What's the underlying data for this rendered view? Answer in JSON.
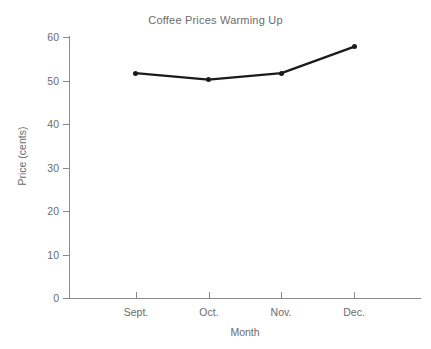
{
  "chart_data": {
    "type": "line",
    "title": "Coffee Prices Warming Up",
    "xlabel": "Month",
    "ylabel": "Price (cents)",
    "categories": [
      "Sept.",
      "Oct.",
      "Nov.",
      "Dec."
    ],
    "values": [
      51.7,
      50.2,
      51.7,
      57.8
    ],
    "series": [
      {
        "name": "Coffee price",
        "values": [
          51.7,
          50.2,
          51.7,
          57.8
        ]
      }
    ],
    "ylim": [
      0,
      60
    ],
    "yticks": [
      0,
      10,
      20,
      30,
      40,
      50,
      60
    ],
    "ytick_labels": [
      "0",
      "10",
      "20",
      "30",
      "40",
      "50",
      "60"
    ],
    "xtick_labels": [
      "Sept.",
      "Oct.",
      "Nov.",
      "Dec."
    ],
    "grid": false,
    "legend": "none",
    "marker": "filled-circle",
    "line_color": "#1b1b1b",
    "axis_color": "#8a8a8a",
    "text_color": "#6b6b6b",
    "background": "#ffffff"
  }
}
